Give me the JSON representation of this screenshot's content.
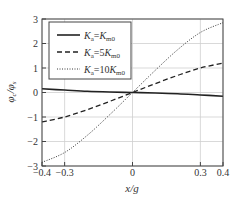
{
  "chart_data": {
    "type": "line",
    "title": "",
    "xlabel": "x/g",
    "ylabel": "φc/φs",
    "xlim": [
      -0.4,
      0.4
    ],
    "ylim": [
      -3,
      3
    ],
    "x_ticks": [
      -0.4,
      -0.3,
      0,
      0.3,
      0.4
    ],
    "x_tick_labels": [
      "−0.4",
      "−0.3",
      "0",
      "0.3",
      "0.4"
    ],
    "y_ticks": [
      -3,
      -2,
      -1,
      0,
      1,
      2,
      3
    ],
    "y_tick_labels": [
      "−3",
      "−2",
      "−1",
      "0",
      "1",
      "2",
      "3"
    ],
    "grid": true,
    "legend_position": "upper left",
    "x": [
      -0.4,
      -0.3,
      -0.2,
      -0.1,
      0,
      0.1,
      0.2,
      0.3,
      0.4
    ],
    "series": [
      {
        "name": "Ka=Km0",
        "label_main": "K",
        "label_sub1": "a",
        "label_eq": "=K",
        "label_sub2": "m0",
        "style": "solid",
        "values": [
          0.15,
          0.1,
          0.05,
          0.02,
          0,
          -0.02,
          -0.05,
          -0.1,
          -0.15
        ]
      },
      {
        "name": "Ka=5Km0",
        "label_main": "K",
        "label_sub1": "a",
        "label_eq": "=5K",
        "label_sub2": "m0",
        "style": "dashed",
        "values": [
          -1.2,
          -1.0,
          -0.7,
          -0.36,
          0,
          0.36,
          0.7,
          1.0,
          1.2
        ]
      },
      {
        "name": "Ka=10Km0",
        "label_main": "K",
        "label_sub1": "a",
        "label_eq": "=10K",
        "label_sub2": "m0",
        "style": "dotted",
        "values": [
          -2.85,
          -2.45,
          -1.75,
          -0.9,
          0,
          0.9,
          1.75,
          2.45,
          2.85
        ]
      }
    ]
  },
  "ylabel_parts": {
    "main1": "φ",
    "sub1": "c",
    "slash": "/",
    "main2": "φ",
    "sub2": "s"
  }
}
